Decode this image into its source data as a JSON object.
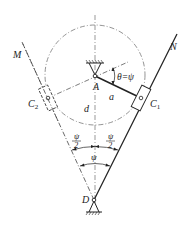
{
  "diagram": {
    "labels": {
      "M": "M",
      "N": "N",
      "A": "A",
      "C1": "C",
      "C1_sub": "1",
      "C2": "C",
      "C2_sub": "2",
      "D": "D",
      "a": "a",
      "d": "d",
      "theta": "θ=ψ",
      "psi": "ψ",
      "psi_half_num": "ψ",
      "psi_half_den": "2"
    },
    "colors": {
      "line": "#222222",
      "construction": "#555555"
    }
  }
}
